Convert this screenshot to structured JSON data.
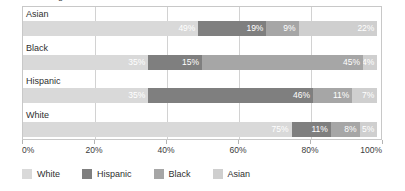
{
  "chart_data": {
    "type": "bar",
    "subtype": "stacked-horizontal-100pct",
    "title": "Percentage",
    "xlabel": "",
    "ylabel": "",
    "xlim": [
      0,
      100
    ],
    "grid": true,
    "legend_position": "bottom",
    "categories": [
      "Asian",
      "Black",
      "Hispanic",
      "White"
    ],
    "tick_labels": [
      "0%",
      "20%",
      "40%",
      "60%",
      "80%",
      "100%"
    ],
    "tick_values": [
      0,
      20,
      40,
      60,
      80,
      100
    ],
    "series": [
      {
        "name": "White",
        "color": "#d9d9d9",
        "values": [
          49,
          35,
          35,
          75
        ]
      },
      {
        "name": "Hispanic",
        "color": "#7f7f7f",
        "values": [
          19,
          15,
          46,
          11
        ]
      },
      {
        "name": "Black",
        "color": "#a6a6a6",
        "values": [
          9,
          45,
          11,
          8
        ]
      },
      {
        "name": "Asian",
        "color": "#cfcfcf",
        "values": [
          22,
          4,
          7,
          5
        ]
      }
    ],
    "rows": [
      {
        "category": "Asian",
        "segments": [
          {
            "series": "White",
            "value": 49,
            "label": "49%",
            "color": "#d9d9d9"
          },
          {
            "series": "Hispanic",
            "value": 19,
            "label": "19%",
            "color": "#7f7f7f"
          },
          {
            "series": "Black",
            "value": 9,
            "label": "9%",
            "color": "#a6a6a6"
          },
          {
            "series": "Asian",
            "value": 22,
            "label": "22%",
            "color": "#cfcfcf"
          }
        ]
      },
      {
        "category": "Black",
        "segments": [
          {
            "series": "White",
            "value": 35,
            "label": "35%",
            "color": "#d9d9d9"
          },
          {
            "series": "Hispanic",
            "value": 15,
            "label": "15%",
            "color": "#7f7f7f"
          },
          {
            "series": "Black",
            "value": 45,
            "label": "45%",
            "color": "#a6a6a6"
          },
          {
            "series": "Asian",
            "value": 4,
            "label": "4%",
            "color": "#cfcfcf"
          }
        ]
      },
      {
        "category": "Hispanic",
        "segments": [
          {
            "series": "White",
            "value": 35,
            "label": "35%",
            "color": "#d9d9d9"
          },
          {
            "series": "Hispanic",
            "value": 46,
            "label": "46%",
            "color": "#7f7f7f"
          },
          {
            "series": "Black",
            "value": 11,
            "label": "11%",
            "color": "#a6a6a6"
          },
          {
            "series": "Asian",
            "value": 7,
            "label": "7%",
            "color": "#cfcfcf"
          }
        ]
      },
      {
        "category": "White",
        "segments": [
          {
            "series": "White",
            "value": 75,
            "label": "75%",
            "color": "#d9d9d9"
          },
          {
            "series": "Hispanic",
            "value": 11,
            "label": "11%",
            "color": "#7f7f7f"
          },
          {
            "series": "Black",
            "value": 8,
            "label": "8%",
            "color": "#a6a6a6"
          },
          {
            "series": "Asian",
            "value": 5,
            "label": "5%",
            "color": "#cfcfcf"
          }
        ]
      }
    ],
    "legend": [
      {
        "label": "White",
        "color": "#d9d9d9"
      },
      {
        "label": "Hispanic",
        "color": "#7f7f7f"
      },
      {
        "label": "Black",
        "color": "#a6a6a6"
      },
      {
        "label": "Asian",
        "color": "#cfcfcf"
      }
    ]
  }
}
